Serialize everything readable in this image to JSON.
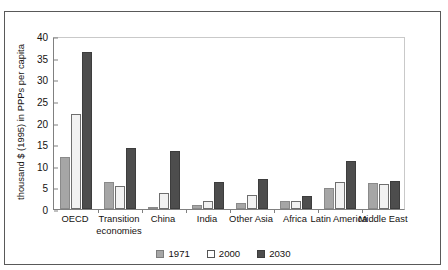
{
  "figure": {
    "title_partial": "a figure title clipped above the frame"
  },
  "legend": {
    "position": "bottom-center",
    "entries": [
      {
        "label": "1971",
        "swatch": "legend-swatch-1971",
        "color": "#a6a6a6"
      },
      {
        "label": "2000",
        "swatch": "legend-swatch-2000",
        "color": "#ffffff"
      },
      {
        "label": "2030",
        "swatch": "legend-swatch-2030",
        "color": "#4d4d4d"
      }
    ]
  },
  "chart_data": {
    "type": "bar",
    "title": "",
    "xlabel": "",
    "ylabel": "thousand $ (1995) in PPPs per capita",
    "ylim": [
      0,
      40
    ],
    "yticks": [
      0,
      5,
      10,
      15,
      20,
      25,
      30,
      35,
      40
    ],
    "ytick_labels": [
      "0",
      "5",
      "10",
      "15",
      "20",
      "25",
      "30",
      "35",
      "40"
    ],
    "grid": false,
    "legend_position": "bottom-center",
    "categories": [
      "OECD",
      "Transition economies",
      "China",
      "India",
      "Other Asia",
      "Africa",
      "Latin America",
      "Middle East"
    ],
    "series": [
      {
        "name": "1971",
        "color": "#a6a6a6",
        "values": [
          12.0,
          6.2,
          0.5,
          1.0,
          1.5,
          1.8,
          4.8,
          6.0
        ]
      },
      {
        "name": "2000",
        "color": "#f2f2f2",
        "values": [
          22.0,
          5.3,
          3.8,
          1.8,
          3.2,
          1.8,
          6.2,
          5.8
        ]
      },
      {
        "name": "2030",
        "color": "#4d4d4d",
        "values": [
          36.3,
          14.2,
          13.5,
          6.3,
          7.0,
          3.0,
          11.1,
          6.5
        ]
      }
    ]
  }
}
